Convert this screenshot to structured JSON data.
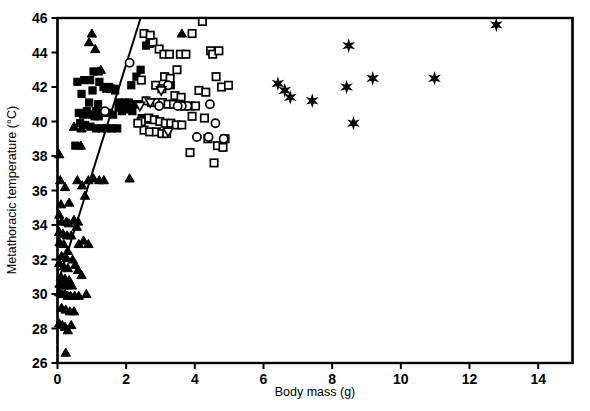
{
  "chart_data": {
    "type": "scatter",
    "title": "",
    "xlabel": "Body mass (g)",
    "ylabel": "Metathoracic temperature (°C)",
    "xlim": [
      0,
      15
    ],
    "ylim": [
      26,
      46
    ],
    "xticks": [
      0,
      2,
      4,
      6,
      8,
      10,
      12,
      14
    ],
    "yticks": [
      26,
      28,
      30,
      32,
      34,
      36,
      38,
      40,
      42,
      44,
      46
    ],
    "grid": false,
    "legend": "none",
    "colors": {
      "marker": "#000000",
      "axis": "#000000",
      "background": "#ffffff"
    },
    "regression_line": {
      "x": [
        0.0,
        2.42
      ],
      "y": [
        30.55,
        46.0
      ],
      "style": "solid",
      "color": "#000000"
    },
    "series": [
      {
        "name": "filled-triangle-up",
        "marker": "triangle-up",
        "fill": "solid",
        "points": [
          [
            0.05,
            38.1
          ],
          [
            0.08,
            36.6
          ],
          [
            0.22,
            36.2
          ],
          [
            0.1,
            35.2
          ],
          [
            0.05,
            34.6
          ],
          [
            0.12,
            34.2
          ],
          [
            0.26,
            34.2
          ],
          [
            0.33,
            34.1
          ],
          [
            0.05,
            33.6
          ],
          [
            0.16,
            33.5
          ],
          [
            0.28,
            33.4
          ],
          [
            0.4,
            33.4
          ],
          [
            0.06,
            33.0
          ],
          [
            0.18,
            32.9
          ],
          [
            0.62,
            32.9
          ],
          [
            0.3,
            32.5
          ],
          [
            0.12,
            32.2
          ],
          [
            0.26,
            32.1
          ],
          [
            0.05,
            31.8
          ],
          [
            0.18,
            31.6
          ],
          [
            0.3,
            31.5
          ],
          [
            0.1,
            31.0
          ],
          [
            0.22,
            30.9
          ],
          [
            0.34,
            30.8
          ],
          [
            0.06,
            30.6
          ],
          [
            0.18,
            30.5
          ],
          [
            0.3,
            30.5
          ],
          [
            0.42,
            30.5
          ],
          [
            0.05,
            30.1
          ],
          [
            0.14,
            30.0
          ],
          [
            0.22,
            30.0
          ],
          [
            0.3,
            29.9
          ],
          [
            0.38,
            29.9
          ],
          [
            0.5,
            29.9
          ],
          [
            0.62,
            29.9
          ],
          [
            0.12,
            29.2
          ],
          [
            0.24,
            29.1
          ],
          [
            0.36,
            29.0
          ],
          [
            0.05,
            28.3
          ],
          [
            0.14,
            28.2
          ],
          [
            0.22,
            28.1
          ],
          [
            0.3,
            27.9
          ],
          [
            0.24,
            26.6
          ],
          [
            0.58,
            36.6
          ],
          [
            0.72,
            36.3
          ],
          [
            0.9,
            36.6
          ],
          [
            1.05,
            36.7
          ],
          [
            1.22,
            36.6
          ],
          [
            1.35,
            36.6
          ],
          [
            2.1,
            36.7
          ],
          [
            0.8,
            35.7
          ],
          [
            0.68,
            38.6
          ],
          [
            0.7,
            39.6
          ],
          [
            0.48,
            39.7
          ],
          [
            1.1,
            44.2
          ],
          [
            1.18,
            42.9
          ],
          [
            1.26,
            43.0
          ],
          [
            3.62,
            45.1
          ],
          [
            1.0,
            45.1
          ],
          [
            0.92,
            44.6
          ],
          [
            0.34,
            35.3
          ],
          [
            0.48,
            34.3
          ],
          [
            0.56,
            33.9
          ],
          [
            0.6,
            34.2
          ],
          [
            0.76,
            33.1
          ],
          [
            0.9,
            32.9
          ],
          [
            0.44,
            32.0
          ],
          [
            0.52,
            31.7
          ],
          [
            0.6,
            31.4
          ],
          [
            0.7,
            31.1
          ],
          [
            0.84,
            30.0
          ],
          [
            0.48,
            29.0
          ],
          [
            0.4,
            28.2
          ]
        ]
      },
      {
        "name": "filled-square",
        "marker": "square",
        "fill": "solid",
        "points": [
          [
            0.58,
            42.3
          ],
          [
            0.95,
            42.4
          ],
          [
            1.22,
            42.3
          ],
          [
            1.02,
            41.8
          ],
          [
            0.7,
            41.6
          ],
          [
            0.92,
            41.1
          ],
          [
            1.18,
            41.0
          ],
          [
            1.42,
            41.9
          ],
          [
            1.55,
            41.9
          ],
          [
            1.68,
            41.8
          ],
          [
            0.86,
            40.6
          ],
          [
            1.12,
            40.6
          ],
          [
            1.3,
            40.5
          ],
          [
            1.48,
            40.5
          ],
          [
            1.62,
            40.4
          ],
          [
            1.78,
            40.8
          ],
          [
            1.92,
            40.8
          ],
          [
            0.62,
            40.5
          ],
          [
            0.74,
            40.4
          ],
          [
            0.98,
            40.4
          ],
          [
            1.08,
            40.3
          ],
          [
            1.2,
            40.3
          ],
          [
            0.66,
            39.9
          ],
          [
            0.8,
            39.8
          ],
          [
            0.96,
            39.7
          ],
          [
            1.12,
            39.6
          ],
          [
            1.28,
            39.6
          ],
          [
            1.44,
            39.6
          ],
          [
            1.58,
            39.6
          ],
          [
            1.74,
            39.6
          ],
          [
            1.88,
            40.6
          ],
          [
            2.02,
            40.7
          ],
          [
            2.18,
            40.6
          ],
          [
            1.34,
            42.0
          ],
          [
            1.5,
            42.0
          ],
          [
            1.66,
            41.9
          ],
          [
            1.8,
            41.1
          ],
          [
            1.95,
            41.1
          ],
          [
            2.08,
            41.1
          ],
          [
            2.22,
            41.0
          ],
          [
            2.35,
            41.0
          ],
          [
            0.52,
            38.6
          ],
          [
            2.42,
            43.0
          ],
          [
            2.3,
            42.6
          ],
          [
            2.58,
            44.4
          ],
          [
            2.68,
            44.5
          ],
          [
            3.3,
            42.1
          ],
          [
            2.45,
            40.2
          ],
          [
            2.6,
            40.1
          ],
          [
            0.78,
            42.4
          ],
          [
            1.05,
            42.9
          ],
          [
            2.15,
            42.1
          ]
        ]
      },
      {
        "name": "open-square",
        "marker": "square",
        "fill": "open",
        "points": [
          [
            2.52,
            45.1
          ],
          [
            2.78,
            44.6
          ],
          [
            2.96,
            44.2
          ],
          [
            3.1,
            43.9
          ],
          [
            3.26,
            43.9
          ],
          [
            2.7,
            45.0
          ],
          [
            4.22,
            45.8
          ],
          [
            3.92,
            45.1
          ],
          [
            4.46,
            44.1
          ],
          [
            4.52,
            43.9
          ],
          [
            3.58,
            43.9
          ],
          [
            3.74,
            43.9
          ],
          [
            3.12,
            42.6
          ],
          [
            3.28,
            42.5
          ],
          [
            4.62,
            42.6
          ],
          [
            4.78,
            42.0
          ],
          [
            4.98,
            42.1
          ],
          [
            2.86,
            42.1
          ],
          [
            3.04,
            41.9
          ],
          [
            3.42,
            41.5
          ],
          [
            3.6,
            41.4
          ],
          [
            4.12,
            41.8
          ],
          [
            4.32,
            41.7
          ],
          [
            2.58,
            41.2
          ],
          [
            2.74,
            41.1
          ],
          [
            2.9,
            41.1
          ],
          [
            3.06,
            41.1
          ],
          [
            3.22,
            41.0
          ],
          [
            3.38,
            41.0
          ],
          [
            3.54,
            41.0
          ],
          [
            3.7,
            40.9
          ],
          [
            3.86,
            40.9
          ],
          [
            4.02,
            40.9
          ],
          [
            2.66,
            40.2
          ],
          [
            2.82,
            40.1
          ],
          [
            2.98,
            40.0
          ],
          [
            3.14,
            39.9
          ],
          [
            3.3,
            39.9
          ],
          [
            3.46,
            39.8
          ],
          [
            3.62,
            39.8
          ],
          [
            2.52,
            39.5
          ],
          [
            2.68,
            39.4
          ],
          [
            2.88,
            39.4
          ],
          [
            3.04,
            39.3
          ],
          [
            3.18,
            39.3
          ],
          [
            4.66,
            38.6
          ],
          [
            4.82,
            38.5
          ],
          [
            4.56,
            37.6
          ],
          [
            2.44,
            40.0
          ],
          [
            2.34,
            39.9
          ],
          [
            4.38,
            39.0
          ],
          [
            3.86,
            38.2
          ],
          [
            2.44,
            42.4
          ],
          [
            4.88,
            39.0
          ],
          [
            4.28,
            40.2
          ],
          [
            3.48,
            43.0
          ],
          [
            4.7,
            44.1
          ],
          [
            3.92,
            40.3
          ]
        ]
      },
      {
        "name": "open-circle",
        "marker": "circle",
        "fill": "open",
        "points": [
          [
            2.1,
            43.4
          ],
          [
            1.38,
            40.6
          ],
          [
            3.22,
            42.1
          ],
          [
            4.44,
            41.0
          ],
          [
            3.78,
            40.9
          ],
          [
            3.62,
            40.9
          ],
          [
            3.5,
            40.9
          ],
          [
            4.6,
            39.9
          ],
          [
            4.4,
            39.1
          ],
          [
            4.84,
            39.0
          ],
          [
            4.06,
            39.1
          ],
          [
            2.96,
            40.9
          ]
        ]
      },
      {
        "name": "open-triangle-down",
        "marker": "triangle-down",
        "fill": "open",
        "points": [
          [
            3.02,
            41.8
          ],
          [
            2.7,
            41.1
          ],
          [
            3.22,
            39.4
          ],
          [
            2.4,
            40.9
          ]
        ]
      },
      {
        "name": "star",
        "marker": "star6",
        "fill": "solid",
        "points": [
          [
            6.42,
            42.2
          ],
          [
            6.62,
            41.8
          ],
          [
            6.78,
            41.4
          ],
          [
            7.42,
            41.2
          ],
          [
            8.48,
            44.4
          ],
          [
            8.42,
            42.0
          ],
          [
            9.18,
            42.5
          ],
          [
            8.62,
            39.9
          ],
          [
            10.98,
            42.5
          ],
          [
            12.78,
            45.6
          ]
        ]
      }
    ]
  },
  "axes": {
    "x_tick_labels": [
      "0",
      "2",
      "4",
      "6",
      "8",
      "10",
      "12",
      "14"
    ],
    "y_tick_labels": [
      "26",
      "28",
      "30",
      "32",
      "34",
      "36",
      "38",
      "40",
      "42",
      "44",
      "46"
    ]
  }
}
